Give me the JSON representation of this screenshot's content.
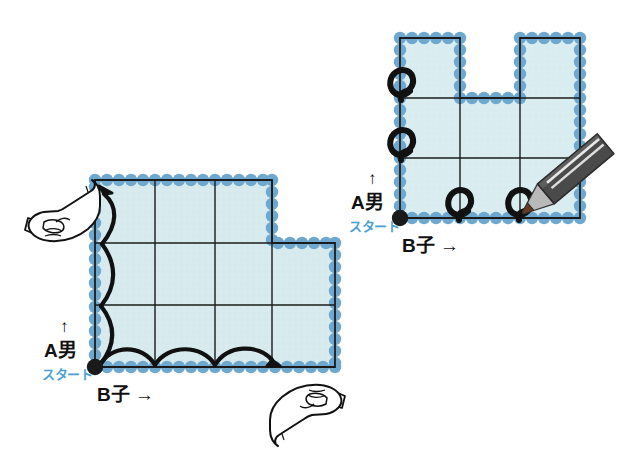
{
  "figure": {
    "title_hidden": "",
    "background_color": "#ffffff",
    "cell_fill": "#d7eaee",
    "cell_fill_alt": "#cfe6ec",
    "dot_color": "#6fa8cf",
    "dot_color_dark": "#5b96c2",
    "grid_line_color": "#1b1b1b",
    "outline_color": "#1b1b1b",
    "marker_color": "#111111",
    "start_label_color": "#4a9fd4",
    "pencil_body_color": "#4a4a4a",
    "pencil_wood_color": "#b9b9b9",
    "pencil_tip_color": "#6b3a20",
    "pencil_stripe_color": "#e8e8e8"
  },
  "panels": [
    {
      "id": "left-panel",
      "name": "L-shaped board with traced path",
      "shape": "L-shape",
      "columns": 4,
      "rows": 3,
      "cells_removed": [
        "row1-col4"
      ],
      "start_point": {
        "x": 0,
        "y": 0,
        "label": "start-dot"
      },
      "axis_labels": {
        "vertical_name": "A男",
        "vertical_arrow": "↑",
        "horizontal_name": "B子",
        "horizontal_arrow": "→",
        "start": "スタート"
      },
      "path_markers": {
        "type": "arcs",
        "vertical_arcs": 3,
        "horizontal_arcs": 3,
        "vertical_arrow_direction": "up",
        "horizontal_arrow_direction": "right"
      },
      "hands": [
        {
          "id": "hand-top-left",
          "points": "up-right"
        },
        {
          "id": "hand-bottom-right",
          "points": "up-left"
        }
      ]
    },
    {
      "id": "right-panel",
      "name": "U-shaped board with loop markers",
      "shape": "U-shape",
      "columns": 3,
      "rows": 3,
      "cells_removed": [
        "row1-col2"
      ],
      "start_point": {
        "x": 0,
        "y": 0,
        "label": "start-dot"
      },
      "axis_labels": {
        "vertical_name": "A男",
        "vertical_arrow": "↑",
        "horizontal_name": "B子",
        "horizontal_arrow": "→",
        "start": "スタート"
      },
      "path_markers": {
        "type": "loops",
        "count": 4,
        "vertical_loops": 2,
        "horizontal_loops": 2
      },
      "tools": [
        {
          "id": "pencil",
          "name": "pencil",
          "angle_deg": -35
        }
      ]
    }
  ],
  "labels": {
    "left": {
      "a_otoko": "A男",
      "up_arrow": "↑",
      "start": "スタート",
      "b_ko": "B子 →"
    },
    "right": {
      "a_otoko": "A男",
      "up_arrow": "↑",
      "start": "スタート",
      "b_ko": "B子 →"
    }
  }
}
